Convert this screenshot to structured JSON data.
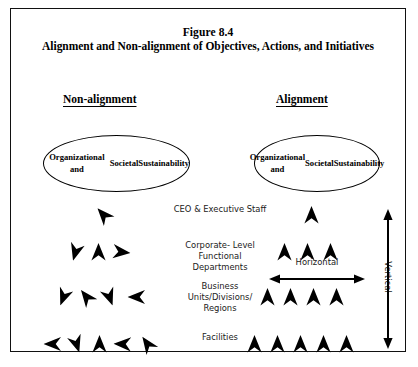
{
  "figure": {
    "title_line1": "Figure 8.4",
    "title_line2": "Alignment and Non-alignment of Objectives, Actions, and Initiatives",
    "border_color": "#111111",
    "background": "#ffffff",
    "arrow_color": "#000000"
  },
  "columns": {
    "left_heading": "Non-alignment",
    "right_heading": "Alignment"
  },
  "ovals": {
    "left_text": "Organizational and Societal Sustainability",
    "right_text": "Organizational and Societal Sustainability",
    "left_lines": [
      "Organizational and",
      "Societal",
      "Sustainability"
    ],
    "right_lines": [
      "Organizational and",
      "Societal",
      "Sustainability"
    ]
  },
  "row_labels": [
    {
      "id": "ceo",
      "text": "CEO & Executive Staff"
    },
    {
      "id": "corporate",
      "text": "Corporate- Level Functional Departments"
    },
    {
      "id": "business",
      "text": "Business Units/Divisions/ Regions"
    },
    {
      "id": "facilities",
      "text": "Facilities"
    }
  ],
  "measures": {
    "horizontal_label": "Horizontal",
    "vertical_label": "Vertical"
  },
  "diagram_data": {
    "type": "diagram",
    "description": "Two arrow clusters compare non-aligned (scattered arrow directions) versus aligned (all arrows pointing up) organizational levels beneath a sustainability objective oval.",
    "levels": [
      "CEO & Executive Staff",
      "Corporate-Level Functional Departments",
      "Business Units/Divisions/Regions",
      "Facilities"
    ],
    "arrows_per_level": [
      1,
      3,
      4,
      5
    ],
    "non_alignment_rotations_deg": [
      [
        -42
      ],
      [
        196,
        0,
        96
      ],
      [
        201,
        -38,
        160,
        270
      ],
      [
        270,
        162,
        0,
        272,
        -35
      ]
    ],
    "alignment_rotations_deg": [
      [
        0
      ],
      [
        0,
        0,
        0
      ],
      [
        0,
        0,
        0,
        0
      ],
      [
        0,
        0,
        0,
        0,
        0
      ]
    ]
  }
}
